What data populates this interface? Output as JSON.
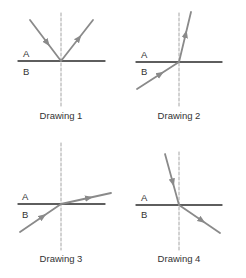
{
  "colors": {
    "background": "#ffffff",
    "interface": "#2a2a2a",
    "normal": "#9a9a9a",
    "ray": "#8a8a8a",
    "text": "#333333"
  },
  "drawings": [
    {
      "caption": "Drawing 1",
      "medium_top": "A",
      "medium_bottom": "B",
      "description": "Ray in A strikes boundary and reflects back into A",
      "interface": {
        "x1": 18,
        "y1": 61,
        "x2": 105,
        "y2": 61
      },
      "normal": {
        "x": 61,
        "y1": 13,
        "y2": 106
      },
      "ray_in": {
        "x1": 30,
        "y1": 20,
        "x2": 61,
        "y2": 61
      },
      "ray_out": {
        "x1": 61,
        "y1": 61,
        "x2": 93,
        "y2": 20
      },
      "label_a": {
        "x": 23,
        "y": 57
      },
      "label_b": {
        "x": 23,
        "y": 75
      },
      "caption_pos": {
        "x": 61,
        "y": 119
      }
    },
    {
      "caption": "Drawing 2",
      "medium_top": "A",
      "medium_bottom": "B",
      "description": "Ray from B refracts into A, bending toward the normal",
      "interface": {
        "x1": 136,
        "y1": 62,
        "x2": 222,
        "y2": 62
      },
      "normal": {
        "x": 179,
        "y1": 13,
        "y2": 106
      },
      "ray_in": {
        "x1": 137,
        "y1": 89,
        "x2": 179,
        "y2": 62
      },
      "ray_out": {
        "x1": 179,
        "y1": 62,
        "x2": 191,
        "y2": 12
      },
      "label_a": {
        "x": 141,
        "y": 58
      },
      "label_b": {
        "x": 141,
        "y": 75
      },
      "caption_pos": {
        "x": 179,
        "y": 119
      }
    },
    {
      "caption": "Drawing 3",
      "medium_top": "A",
      "medium_bottom": "B",
      "description": "Ray from B refracts into A, bending away from the normal",
      "interface": {
        "x1": 18,
        "y1": 204,
        "x2": 105,
        "y2": 204
      },
      "normal": {
        "x": 61,
        "y1": 143,
        "y2": 250
      },
      "ray_in": {
        "x1": 20,
        "y1": 232,
        "x2": 61,
        "y2": 204
      },
      "ray_out": {
        "x1": 61,
        "y1": 204,
        "x2": 111,
        "y2": 193
      },
      "label_a": {
        "x": 22,
        "y": 200
      },
      "label_b": {
        "x": 22,
        "y": 218
      },
      "caption_pos": {
        "x": 61,
        "y": 262
      }
    },
    {
      "caption": "Drawing 4",
      "medium_top": "A",
      "medium_bottom": "B",
      "description": "Ray from A refracts into B, bending away from the normal",
      "interface": {
        "x1": 136,
        "y1": 205,
        "x2": 222,
        "y2": 205
      },
      "normal": {
        "x": 179,
        "y1": 152,
        "y2": 250
      },
      "ray_in": {
        "x1": 165,
        "y1": 154,
        "x2": 179,
        "y2": 205
      },
      "ray_out": {
        "x1": 179,
        "y1": 205,
        "x2": 220,
        "y2": 233
      },
      "label_a": {
        "x": 141,
        "y": 201
      },
      "label_b": {
        "x": 141,
        "y": 218
      },
      "caption_pos": {
        "x": 179,
        "y": 262
      }
    }
  ]
}
